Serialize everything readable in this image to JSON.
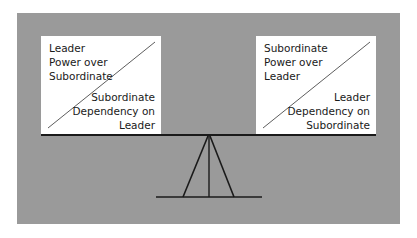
{
  "diagram": {
    "colors": {
      "background": "#ffffff",
      "panel": "#9a9a9a",
      "box": "#ffffff",
      "line": "#1a1a1a"
    },
    "left_box": {
      "top_label": [
        "Leader",
        "Power over",
        "Subordinate"
      ],
      "bottom_label": [
        "Subordinate",
        "Dependency on",
        "Leader"
      ]
    },
    "right_box": {
      "top_label": [
        "Subordinate",
        "Power over",
        "Leader"
      ],
      "bottom_label": [
        "Leader",
        "Dependency on",
        "Subordinate"
      ]
    }
  }
}
